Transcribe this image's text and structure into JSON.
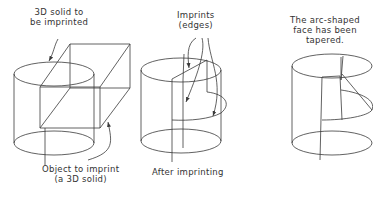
{
  "figures": [
    {
      "name": "before-imprinting",
      "labels": {
        "top_line1": "3D solid to",
        "top_line2": "be imprinted",
        "bottom_line1": "Object to imprint",
        "bottom_line2": "(a 3D solid)"
      }
    },
    {
      "name": "after-imprinting",
      "labels": {
        "top_line1": "Imprints",
        "top_line2": "(edges)",
        "bottom_line1": "After imprinting"
      }
    },
    {
      "name": "tapered",
      "labels": {
        "top_line1": "The arc-shaped",
        "top_line2": "face has been",
        "top_line3": "tapered."
      }
    }
  ],
  "colors": {
    "line": "#3a3a3a",
    "text": "#333333",
    "background": "#ffffff"
  }
}
